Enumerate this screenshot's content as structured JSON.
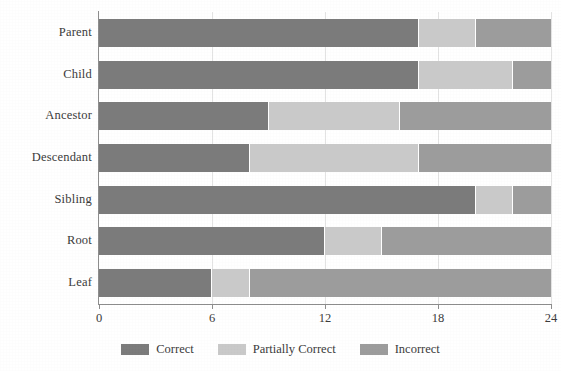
{
  "chart_data": {
    "type": "bar",
    "orientation": "horizontal",
    "stacked": true,
    "title": "",
    "xlabel": "",
    "ylabel": "",
    "xlim": [
      0,
      24
    ],
    "xticks": [
      0,
      6,
      12,
      18,
      24
    ],
    "xtick_labels": [
      "0",
      "6",
      "12",
      "18",
      "24"
    ],
    "grid": true,
    "grid_axis": "x",
    "legend_position": "bottom-center",
    "categories": [
      "Parent",
      "Child",
      "Ancestor",
      "Descendant",
      "Sibling",
      "Root",
      "Leaf"
    ],
    "series": [
      {
        "name": "Correct",
        "color": "#7b7b7b",
        "values": [
          17,
          17,
          9,
          8,
          20,
          12,
          6
        ]
      },
      {
        "name": "Partially Correct",
        "color": "#c9c9c9",
        "values": [
          3,
          5,
          7,
          9,
          2,
          3,
          2
        ]
      },
      {
        "name": "Incorrect",
        "color": "#9c9c9c",
        "values": [
          4,
          2,
          8,
          7,
          2,
          9,
          16
        ]
      }
    ],
    "row_totals": [
      24,
      24,
      24,
      24,
      24,
      24,
      24
    ]
  },
  "axis": {
    "tick_labels": [
      "0",
      "6",
      "12",
      "18",
      "24"
    ]
  },
  "legend": {
    "items": [
      {
        "label": "Correct",
        "color": "#7b7b7b"
      },
      {
        "label": "Partially Correct",
        "color": "#c9c9c9"
      },
      {
        "label": "Incorrect",
        "color": "#9c9c9c"
      }
    ]
  }
}
